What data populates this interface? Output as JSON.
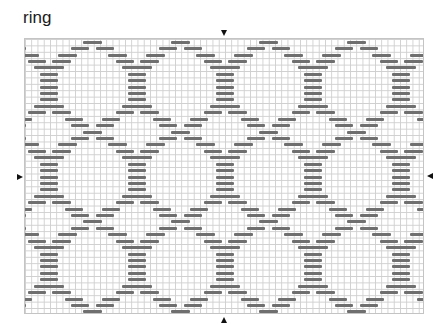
{
  "title": "ring",
  "colors": {
    "bar": "#6f6f6f",
    "grid_line": "#cfcfcf",
    "marker": "#111111",
    "background": "#ffffff"
  },
  "grid": {
    "left": 24,
    "top": 38,
    "width": 400,
    "height": 276,
    "columns": 64,
    "rows": 43,
    "col_pitch": 6.25,
    "row_pitch": 6.42
  },
  "pattern": {
    "period_px": 88,
    "repeats": 6,
    "segments": {
      "A": [
        [
          58,
          77
        ]
      ],
      "B": [
        [
          46,
          64
        ],
        [
          71,
          89
        ]
      ],
      "C": [
        [
          33,
          52
        ],
        [
          83,
          102
        ]
      ],
      "D": [
        [
          3,
          21
        ],
        [
          27,
          46
        ]
      ],
      "E": [
        [
          9,
          39
        ]
      ],
      "S": [
        [
          15,
          33
        ]
      ],
      "F": [
        [
          40,
          58
        ],
        [
          77,
          95
        ]
      ]
    },
    "rows": [
      "A",
      "B",
      "C",
      "D",
      "E",
      "S",
      "S",
      "S",
      "S",
      "S",
      "E",
      "D",
      "F",
      "B",
      "A",
      "B",
      "C",
      "D",
      "E",
      "S",
      "S",
      "S",
      "S",
      "S",
      "E",
      "D",
      "F",
      "B",
      "A",
      "B",
      "C",
      "D",
      "E",
      "S",
      "S",
      "S",
      "S",
      "S",
      "E",
      "D",
      "F",
      "B",
      "A"
    ]
  },
  "markers": [
    {
      "name": "top-center-marker",
      "dir": "down",
      "x": 221,
      "y": 30
    },
    {
      "name": "bottom-center-marker",
      "dir": "up",
      "x": 221,
      "y": 317
    },
    {
      "name": "left-center-marker",
      "dir": "right",
      "x": 17,
      "y": 174
    },
    {
      "name": "right-center-marker",
      "dir": "left",
      "x": 427,
      "y": 173
    }
  ]
}
